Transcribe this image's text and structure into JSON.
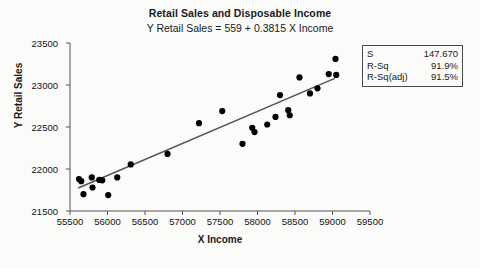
{
  "chart_data": {
    "type": "scatter",
    "title": "Retail Sales and Disposable Income",
    "subtitle": "Y  Retail Sales = 559 + 0.3815 X  Income",
    "xlabel": "X  Income",
    "ylabel": "Y  Retail Sales",
    "xlim": [
      55500,
      59500
    ],
    "ylim": [
      21500,
      23500
    ],
    "xticks": [
      55500,
      56000,
      56500,
      57000,
      57500,
      58000,
      58500,
      59000,
      59500
    ],
    "yticks": [
      21500,
      22000,
      22500,
      23000,
      23500
    ],
    "grid": false,
    "legend": "none",
    "fit_line": {
      "intercept": 559,
      "slope": 0.3815,
      "x_start": 55610,
      "x_end": 59030,
      "color": "#555555"
    },
    "point_color": "#000000",
    "points": [
      {
        "x": 55620,
        "y": 21880
      },
      {
        "x": 55650,
        "y": 21855
      },
      {
        "x": 55680,
        "y": 21700
      },
      {
        "x": 55790,
        "y": 21900
      },
      {
        "x": 55800,
        "y": 21780
      },
      {
        "x": 55890,
        "y": 21870
      },
      {
        "x": 55930,
        "y": 21865
      },
      {
        "x": 56010,
        "y": 21690
      },
      {
        "x": 56130,
        "y": 21900
      },
      {
        "x": 56310,
        "y": 22055
      },
      {
        "x": 56800,
        "y": 22180
      },
      {
        "x": 57220,
        "y": 22545
      },
      {
        "x": 57530,
        "y": 22690
      },
      {
        "x": 57800,
        "y": 22300
      },
      {
        "x": 57930,
        "y": 22490
      },
      {
        "x": 57960,
        "y": 22440
      },
      {
        "x": 58130,
        "y": 22530
      },
      {
        "x": 58240,
        "y": 22620
      },
      {
        "x": 58300,
        "y": 22880
      },
      {
        "x": 58410,
        "y": 22700
      },
      {
        "x": 58430,
        "y": 22640
      },
      {
        "x": 58560,
        "y": 23090
      },
      {
        "x": 58700,
        "y": 22900
      },
      {
        "x": 58800,
        "y": 22960
      },
      {
        "x": 58950,
        "y": 23130
      },
      {
        "x": 59040,
        "y": 23310
      },
      {
        "x": 59050,
        "y": 23120
      }
    ]
  },
  "stats": {
    "rows": [
      {
        "key": "S",
        "value": "147.670"
      },
      {
        "key": "R-Sq",
        "value": "91.9%"
      },
      {
        "key": "R-Sq(adj)",
        "value": "91.5%"
      }
    ]
  }
}
